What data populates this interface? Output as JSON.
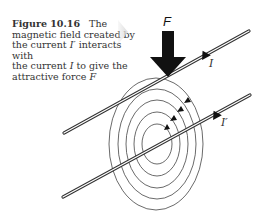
{
  "caption": {
    "figure_number": "Figure 10.16",
    "text_line1": "The",
    "text_line2": "magnetic field created by",
    "text_line3a": "the current ",
    "text_line3b": "I′",
    "text_line3c": " interacts with",
    "text_line4a": "the current ",
    "text_line4b": "I",
    "text_line4c": " to give the",
    "text_line5a": "attractive force ",
    "text_line5b": "F"
  },
  "diagram": {
    "force_label": "F",
    "upper_wire_current_label": "I",
    "lower_wire_current_label": "I′"
  }
}
